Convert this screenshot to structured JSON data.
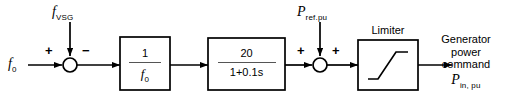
{
  "diagram": {
    "background": "#ffffff",
    "line_color": "#000000",
    "input": {
      "label_f": "f",
      "label_sub": "0"
    },
    "disturbance_top_left": {
      "label_f": "f",
      "label_sub": "VSG"
    },
    "sum1": {
      "sign_left": "+",
      "sign_top": "−"
    },
    "block1": {
      "numerator": "1",
      "denominator_f": "f",
      "denominator_sub": "0"
    },
    "block2": {
      "numerator": "20",
      "denominator": "1+0.1s"
    },
    "feedforward_top_right": {
      "label_p": "P",
      "label_sub": "ref.pu"
    },
    "sum2": {
      "sign_left": "+",
      "sign_top": "+"
    },
    "limiter": {
      "label": "Limiter"
    },
    "output": {
      "line1": "Generator",
      "line2": "power",
      "line3": "command",
      "symbol_p": "P",
      "symbol_sub": "in, pu"
    }
  }
}
